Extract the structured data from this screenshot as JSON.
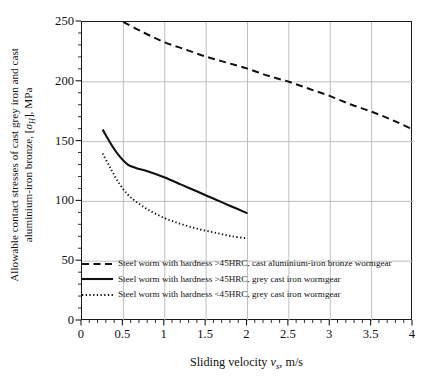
{
  "chart_data": {
    "type": "line",
    "title": "",
    "xlabel": "Sliding velocity v_s, m/s",
    "ylabel": "Allowable contact stresses of cast grey iron and cast aluminium-iron bronze, [σ_H], MPa",
    "xlim": [
      0,
      4
    ],
    "ylim": [
      0,
      250
    ],
    "xticks": [
      0,
      0.5,
      1,
      1.5,
      2,
      2.5,
      3,
      3.5,
      4
    ],
    "xtick_labels": [
      "0",
      "0.5",
      "1",
      "1.5",
      "2",
      "2.5",
      "3",
      "3.5",
      "4"
    ],
    "yticks": [
      0,
      50,
      100,
      150,
      200,
      250
    ],
    "ytick_labels": [
      "0",
      "50",
      "100",
      "150",
      "200",
      "250"
    ],
    "grid": true,
    "grid_color": "#b8b8b8",
    "minor_ticks": true,
    "legend_position": "inside-bottom-left",
    "series": [
      {
        "name": "Steel worm with hardness >45HRC, cast aluminium-iron bronze wormgear",
        "style": "dashed",
        "color": "#111111",
        "x": [
          0.5,
          0.75,
          1.0,
          1.25,
          1.5,
          1.75,
          2.0,
          2.25,
          2.5,
          2.75,
          3.0,
          3.25,
          3.5,
          3.75,
          4.0
        ],
        "y": [
          250,
          241,
          233,
          227,
          221,
          216,
          211,
          205,
          200,
          194,
          188,
          181,
          175,
          168,
          160
        ]
      },
      {
        "name": "Steel worm with hardness >45HRC, grey cast iron wormgear",
        "style": "solid",
        "color": "#111111",
        "x": [
          0.25,
          0.35,
          0.45,
          0.55,
          0.65,
          0.8,
          1.0,
          1.2,
          1.4,
          1.6,
          1.8,
          2.0
        ],
        "y": [
          160,
          148,
          138,
          131,
          128,
          125,
          120,
          114,
          108,
          102,
          96,
          90
        ]
      },
      {
        "name": "Steel worm with hardness <45HRC, grey cast iron wormgear",
        "style": "dotted",
        "color": "#111111",
        "x": [
          0.25,
          0.35,
          0.45,
          0.55,
          0.65,
          0.8,
          1.0,
          1.2,
          1.4,
          1.6,
          1.8,
          2.0
        ],
        "y": [
          140,
          127,
          115,
          106,
          100,
          93,
          86,
          81,
          77,
          74,
          71,
          69
        ]
      }
    ]
  },
  "axes": {
    "ylabel_line1": "Allowable contact stresses of cast grey iron and cast",
    "ylabel_line2_pre": "aluminium-iron bronze, [",
    "ylabel_sigma": "σ",
    "ylabel_sub": "H",
    "ylabel_line2_post": "], MPa",
    "xlabel_pre": "Sliding velocity ",
    "xlabel_v": "v",
    "xlabel_sub": "s",
    "xlabel_post": ", m/s"
  },
  "legend": {
    "items": [
      {
        "style": "dashed",
        "label": "Steel worm with hardness >45HRC, cast aluminium-iron bronze wormgear"
      },
      {
        "style": "solid",
        "label": "Steel worm with hardness >45HRC, grey cast iron wormgear"
      },
      {
        "style": "dotted",
        "label": "Steel worm with hardness <45HRC, grey cast iron wormgear"
      }
    ]
  }
}
